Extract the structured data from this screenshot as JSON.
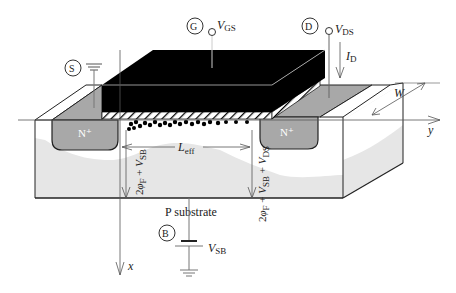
{
  "terminals": {
    "source": {
      "letter": "S"
    },
    "gate": {
      "letter": "G",
      "voltage_main": "V",
      "voltage_sub": "GS"
    },
    "drain": {
      "letter": "D",
      "voltage_main": "V",
      "voltage_sub": "DS",
      "current_main": "I",
      "current_sub": "D"
    },
    "body": {
      "letter": "B",
      "voltage_main": "V",
      "voltage_sub": "SB"
    }
  },
  "regions": {
    "source_doping": "N⁺",
    "drain_doping": "N⁺",
    "substrate": "P substrate"
  },
  "dimensions": {
    "length_main": "L",
    "length_sub": "eff",
    "width": "W"
  },
  "depletion_labels": {
    "source_side": "2φF + VSB",
    "drain_side": "2φF + VSB + VDS"
  },
  "axes": {
    "x": "x",
    "y": "y"
  },
  "colors": {
    "gate": "#000000",
    "n_plus": "#a8a8a8",
    "substrate_fill": "#e6e6e6",
    "depletion": "#ffffff",
    "outline": "#222222"
  }
}
